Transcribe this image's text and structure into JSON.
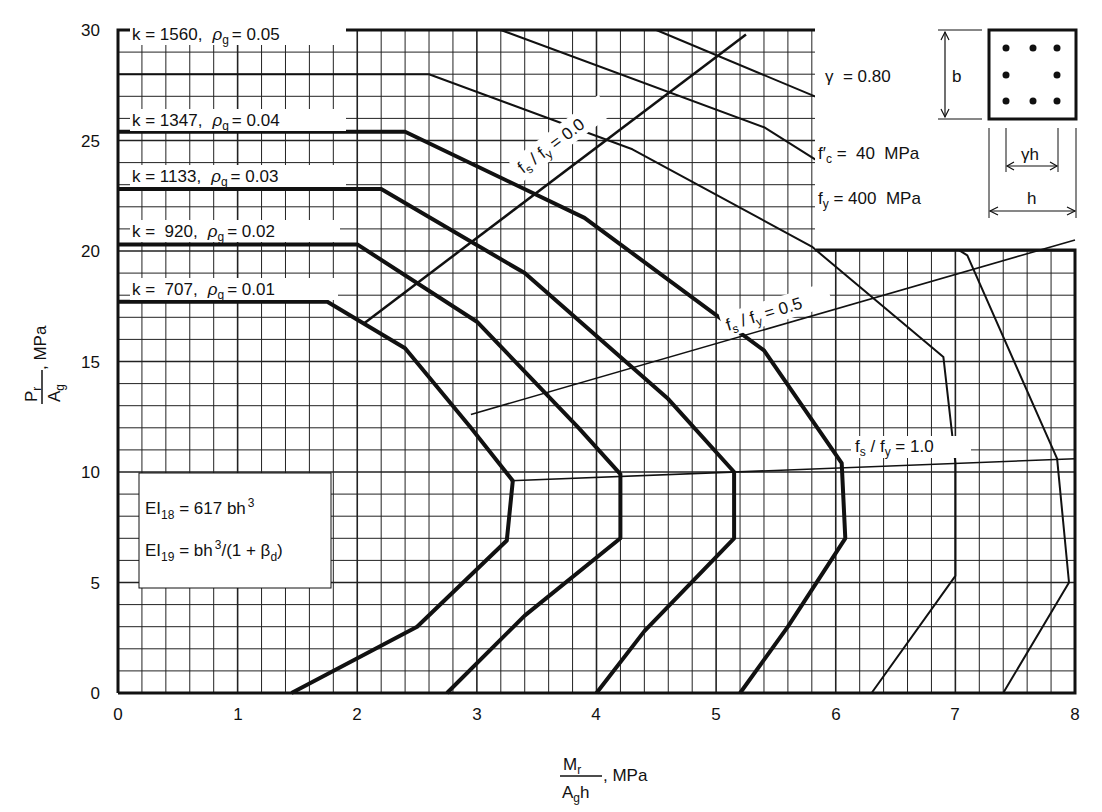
{
  "chart_data": {
    "type": "line",
    "title": "",
    "xlabel": "Mr / (Ag h), MPa",
    "ylabel": "Pr / Ag, MPa",
    "xlim": [
      0,
      8
    ],
    "ylim": [
      0,
      30
    ],
    "x_ticks": [
      "0",
      "1",
      "2",
      "3",
      "4",
      "5",
      "6",
      "7",
      "8"
    ],
    "y_ticks": [
      "0",
      "5",
      "10",
      "15",
      "20",
      "25",
      "30"
    ],
    "grid": true,
    "grid_minor_x": 0.2,
    "grid_minor_y": 1,
    "parameters": {
      "gamma": "γ = 0.80",
      "fc": "f′c = 40 MPa",
      "fy": "fy = 400 MPa"
    },
    "section_diagram": {
      "b": "b",
      "gamma_h": "γh",
      "h": "h"
    },
    "ei_box": {
      "ei18": "EI18 = 617 bh³",
      "ei19": "EI19 = bh³/(1 + βd)"
    },
    "series": [
      {
        "name": "k = 707, ρg = 0.01",
        "k": 707,
        "rho_g": 0.01,
        "weight": "bold",
        "points": [
          [
            0,
            17.7
          ],
          [
            1.75,
            17.7
          ],
          [
            2.4,
            15.6
          ],
          [
            2.95,
            12.0
          ],
          [
            3.3,
            9.6
          ],
          [
            3.25,
            6.9
          ],
          [
            2.5,
            3.0
          ],
          [
            1.45,
            0
          ]
        ]
      },
      {
        "name": "k = 920, ρg = 0.02",
        "k": 920,
        "rho_g": 0.02,
        "weight": "bold",
        "points": [
          [
            0,
            20.3
          ],
          [
            2.0,
            20.3
          ],
          [
            3.0,
            16.8
          ],
          [
            3.85,
            12.0
          ],
          [
            4.2,
            9.9
          ],
          [
            4.2,
            7.0
          ],
          [
            3.4,
            3.5
          ],
          [
            2.75,
            0
          ]
        ]
      },
      {
        "name": "k = 1133, ρg = 0.03",
        "k": 1133,
        "rho_g": 0.03,
        "weight": "bold",
        "points": [
          [
            0,
            22.8
          ],
          [
            2.2,
            22.8
          ],
          [
            3.4,
            19.0
          ],
          [
            4.6,
            13.3
          ],
          [
            5.15,
            10.0
          ],
          [
            5.15,
            7.0
          ],
          [
            4.4,
            2.8
          ],
          [
            4.0,
            0
          ]
        ]
      },
      {
        "name": "k = 1347, ρg = 0.04",
        "k": 1347,
        "rho_g": 0.04,
        "weight": "bold",
        "points": [
          [
            0,
            25.4
          ],
          [
            2.4,
            25.4
          ],
          [
            3.9,
            21.5
          ],
          [
            5.4,
            15.5
          ],
          [
            6.05,
            10.4
          ],
          [
            6.08,
            7.0
          ],
          [
            5.6,
            3.0
          ],
          [
            5.2,
            0
          ]
        ]
      },
      {
        "name": "k = 1560, ρg = 0.05",
        "k": 1560,
        "rho_g": 0.05,
        "weight": "thin",
        "points": [
          [
            0,
            28.0
          ],
          [
            2.6,
            28.0
          ],
          [
            4.3,
            24.6
          ],
          [
            5.8,
            20.2
          ],
          [
            6.9,
            15.2
          ],
          [
            7.0,
            10.4
          ],
          [
            7.0,
            5.3
          ],
          [
            6.3,
            0
          ]
        ]
      },
      {
        "name": "unlabeled outer curve",
        "weight": "thin",
        "points": [
          [
            3.2,
            30
          ],
          [
            5.4,
            25.6
          ],
          [
            7.1,
            19.8
          ],
          [
            7.85,
            10.6
          ],
          [
            7.95,
            5.0
          ],
          [
            7.4,
            0
          ]
        ]
      },
      {
        "name": "unlabeled diagonal a",
        "weight": "thin",
        "points": [
          [
            4.5,
            30
          ],
          [
            6.0,
            26.6
          ],
          [
            8.0,
            20.2
          ]
        ]
      },
      {
        "name": "unlabeled diagonal b",
        "weight": "thin",
        "points": [
          [
            5.9,
            30
          ],
          [
            8.0,
            23.6
          ]
        ]
      },
      {
        "name": "unlabeled diagonal c",
        "weight": "thin",
        "points": [
          [
            7.2,
            30
          ],
          [
            8.0,
            27.3
          ]
        ]
      }
    ],
    "strain_lines": [
      {
        "name": "fs / fy = 0.0",
        "points": [
          [
            2.05,
            16.7
          ],
          [
            5.25,
            29.8
          ]
        ]
      },
      {
        "name": "fs / fy = 0.5",
        "points": [
          [
            2.95,
            12.6
          ],
          [
            8.0,
            20.5
          ]
        ]
      },
      {
        "name": "fs / fy = 1.0",
        "points": [
          [
            3.28,
            9.6
          ],
          [
            8.0,
            10.6
          ]
        ]
      }
    ],
    "annotations": [
      "k = 1560, ρg = 0.05",
      "k = 1347, ρg = 0.04",
      "k = 1133, ρg = 0.03",
      "k = 920, ρg = 0.02",
      "k = 707, ρg = 0.01",
      "fs / fy = 0.0",
      "fs / fy = 0.5",
      "fs / fy = 1.0"
    ]
  },
  "labels": {
    "y_axis": {
      "num": "P",
      "num_sub": "r",
      "den": "A",
      "den_sub": "g",
      "unit": ", MPa"
    },
    "x_axis": {
      "num": "M",
      "num_sub": "r",
      "den": "A",
      "den_sub": "g",
      "den_tail": "h",
      "unit": ", MPa"
    },
    "curves": [
      {
        "k": "k = 1560,",
        "rho": "ρ",
        "sub": "g",
        "eq": "= 0.05"
      },
      {
        "k": "k = 1347,",
        "rho": "ρ",
        "sub": "g",
        "eq": "= 0.04"
      },
      {
        "k": "k = 1133,",
        "rho": "ρ",
        "sub": "g",
        "eq": "= 0.03"
      },
      {
        "k": "k =  920,",
        "rho": "ρ",
        "sub": "g",
        "eq": "= 0.02"
      },
      {
        "k": "k =  707,",
        "rho": "ρ",
        "sub": "g",
        "eq": "= 0.01"
      }
    ],
    "fs": {
      "f": "f",
      "s": "s",
      "slash": " / f",
      "y": "y",
      "v00": " = 0.0",
      "v05": " = 0.5",
      "v10": " = 1.0"
    },
    "params": {
      "gamma": "γ  = 0.80",
      "fc_f": "f′",
      "fc_sub": "c",
      "fc_val": " =  40  MPa",
      "fy_f": "f",
      "fy_sub": "y",
      "fy_val": " = 400  MPa"
    },
    "section": {
      "b": "b",
      "gh": "γh",
      "h": "h"
    },
    "ei": {
      "ei": "EI",
      "s18": "18",
      "v18": " = 617 bh",
      "p3": "3",
      "s19": "19",
      "v19a": " = bh",
      "v19b": "/(1 + β",
      "sd": "d",
      "v19c": ")"
    }
  }
}
